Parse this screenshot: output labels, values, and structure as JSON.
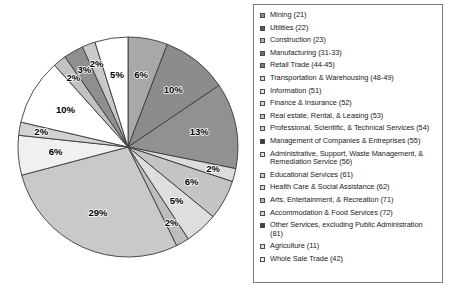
{
  "chart_data": {
    "type": "pie",
    "title": "",
    "legend_position": "right",
    "units": "percent",
    "start_angle_deg": 0,
    "direction": "clockwise",
    "categories": [
      "Mining (21)",
      "Utilities (22)",
      "Construction (23)",
      "Manufacturing (31-33)",
      "Retail Trade (44-45)",
      "Transportation & Warehousing (48-49)",
      "Information (51)",
      "Finance & Insurance (52)",
      "Real estate,  Rental, & Leasing (53)",
      "Professional, Scientific, & Technical Services (54)",
      "Management of Companies & Entreprises (55)",
      "Administrative, Support, Waste Management, &\nRemediation Service (56)",
      "Educational Services (61)",
      "Health Care & Social Assistance (62)",
      "Arts, Entertainment, & Recreation (71)",
      "Accommodation & Food Services (72)",
      "Other Services,  excluding Public Administration (81)",
      "Agriculture (11)",
      "Whole Sale Trade (42)"
    ],
    "values": [
      6,
      10,
      13,
      2,
      6,
      5,
      2,
      29,
      6,
      2,
      10,
      2,
      3,
      2,
      5,
      0,
      0,
      0,
      0
    ],
    "slice_labels": [
      "6%",
      "10%",
      "13%",
      "2%",
      "6%",
      "5%",
      "2%",
      "29%",
      "6%",
      "2%",
      "10%",
      "2%",
      "3%",
      "2%",
      "5%"
    ],
    "slice_colors": [
      "#a8a8a8",
      "#8c8c8c",
      "#919191",
      "#dcdcdc",
      "#c4c4c4",
      "#dedede",
      "#bdbdbd",
      "#c9c9c9",
      "#f0f0f0",
      "#d2d2d2",
      "#ffffff",
      "#c2c2c2",
      "#8f8f8f",
      "#c9c9c9",
      "#ffffff"
    ],
    "legend_swatch_colors": [
      "#8c8c8c",
      "#5a5a5a",
      "#b0b0b0",
      "#6e6e6e",
      "#7a7a7a",
      "#d8d8d8",
      "#e4e4e4",
      "#dcdcdc",
      "#c8c8c8",
      "#d0d0d0",
      "#3a3a3a",
      "#e0e0e0",
      "#cfcfcf",
      "#dcdcdc",
      "#b8b8b8",
      "#d4d4d4",
      "#3f3f3f",
      "#dadada",
      "#ececec"
    ]
  },
  "pie_geometry": {
    "cx": 128,
    "cy": 147,
    "r": 110,
    "label_radius_ratio": 0.66
  }
}
